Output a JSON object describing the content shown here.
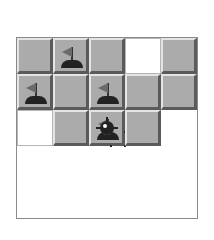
{
  "board": {
    "rows": 5,
    "cols": 5,
    "cells": [
      [
        "covered",
        "mine",
        "flag",
        "covered",
        "mine"
      ],
      [
        "mine",
        "empty",
        "mine",
        "mine",
        "covered"
      ],
      [
        "flag",
        "mine",
        "covered",
        "mine",
        "flag"
      ],
      [
        "covered",
        "covered",
        "mine",
        "empty",
        "mine"
      ],
      [
        "mine",
        "covered",
        "flag",
        "mine",
        "covered"
      ]
    ]
  },
  "colors": {
    "covered": "#ababab",
    "revealed": "#ffffff",
    "mine": "#222222",
    "flag": "#6b6b6b"
  }
}
